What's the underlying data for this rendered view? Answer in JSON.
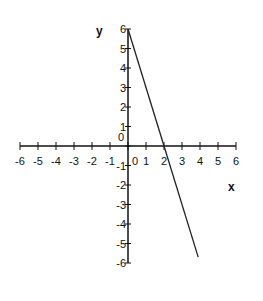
{
  "chart_data": {
    "type": "line",
    "title": "",
    "xlabel": "x",
    "ylabel": "y",
    "xlim": [
      -6,
      6
    ],
    "ylim": [
      -6,
      6
    ],
    "grid": false,
    "legend": null,
    "x_ticks": [
      -6,
      -5,
      -4,
      -3,
      -2,
      -1,
      0,
      1,
      2,
      3,
      4,
      5,
      6
    ],
    "y_ticks": [
      -6,
      -5,
      -4,
      -3,
      -2,
      -1,
      0,
      1,
      2,
      3,
      4,
      5,
      6
    ],
    "series": [
      {
        "name": "y = -3x + 6",
        "x": [
          0,
          2,
          3.9
        ],
        "y": [
          6,
          0,
          -5.7
        ]
      }
    ],
    "annotations": []
  },
  "layout": {
    "origin_px": [
      128,
      146
    ],
    "unit_px_x": 18,
    "unit_px_y": 19.5,
    "line_color": "#222222",
    "axis_color": "#111111"
  }
}
